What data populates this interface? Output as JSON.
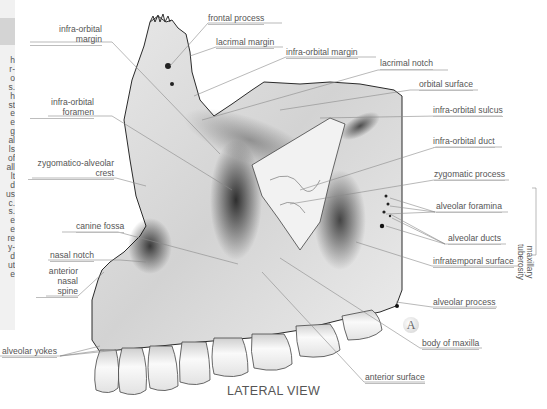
{
  "figure": {
    "view_title": "LATERAL VIEW",
    "badge": "A",
    "sidebar_fragments": [
      "h",
      "r-",
      "o",
      "s.",
      "h",
      "st",
      "e",
      "e",
      "g",
      "al",
      "ls",
      "of",
      "all",
      "lt",
      "d",
      "us",
      "c.",
      "s.",
      "e",
      "e",
      "re",
      "y-",
      "d",
      "ut",
      "e"
    ],
    "labels_left": {
      "infra_orbital_margin_1": "infra-orbital",
      "infra_orbital_margin_2": "margin",
      "infra_orbital_foramen_1": "infra-orbital",
      "infra_orbital_foramen_2": "foramen",
      "zygomatico_alveolar_crest_1": "zygomatico-alveolar",
      "zygomatico_alveolar_crest_2": "crest",
      "canine_fossa": "canine fossa",
      "nasal_notch": "nasal notch",
      "anterior_nasal_spine_1": "anterior",
      "anterior_nasal_spine_2": "nasal",
      "anterior_nasal_spine_3": "spine",
      "alveolar_yokes": "alveolar yokes"
    },
    "labels_top": {
      "frontal_process": "frontal process",
      "lacrimal_margin": "lacrimal margin",
      "infra_orbital_margin": "infra-orbital margin"
    },
    "labels_right": {
      "lacrimal_notch": "lacrimal notch",
      "orbital_surface": "orbital surface",
      "infra_orbital_sulcus": "infra-orbital sulcus",
      "infra_orbital_duct": "infra-orbital duct",
      "zygomatic_process": "zygomatic process",
      "alveolar_foramina": "alveolar foramina",
      "alveolar_ducts": "alveolar ducts",
      "maxillary_tuberosity_1": "maxillary",
      "maxillary_tuberosity_2": "tuberosity",
      "infratemporal_surface": "infratemporal surface",
      "alveolar_process": "alveolar process",
      "body_of_maxilla": "body of maxilla",
      "anterior_surface": "anterior surface"
    },
    "colors": {
      "label_text": "#555555",
      "leader_line": "#8a8a8a",
      "bone_light": "#f4f4f4",
      "bone_dark": "#1e1e1e"
    }
  }
}
